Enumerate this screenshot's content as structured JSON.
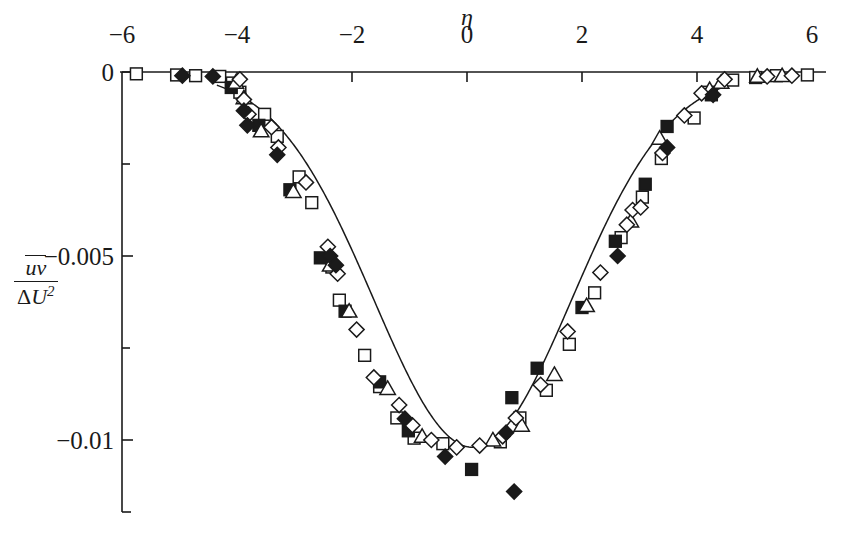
{
  "figure": {
    "background_color": "#ffffff",
    "ink_color": "#1a1a1a"
  },
  "axes": {
    "x_title": "η",
    "y_title_numerator": "uv",
    "y_title_denominator_delta": "Δ",
    "y_title_denominator_u": "U",
    "y_title_denominator_exp": "2",
    "x_ticks": [
      {
        "value": -6,
        "label": "−6"
      },
      {
        "value": -4,
        "label": "−4"
      },
      {
        "value": -2,
        "label": "−2"
      },
      {
        "value": 0,
        "label": "0"
      },
      {
        "value": 2,
        "label": "2"
      },
      {
        "value": 4,
        "label": "4"
      },
      {
        "value": 6,
        "label": "6"
      }
    ],
    "y_ticks": [
      {
        "value": 0,
        "label": "0"
      },
      {
        "value": -0.0025,
        "label": ""
      },
      {
        "value": -0.005,
        "label": "−0.005"
      },
      {
        "value": -0.0075,
        "label": ""
      },
      {
        "value": -0.01,
        "label": "−0.01"
      },
      {
        "value": -0.0125,
        "label": ""
      }
    ],
    "x_axis_position": "top",
    "y_axis_position": "left"
  },
  "chart_data": {
    "type": "scatter",
    "title": "",
    "xlabel": "η",
    "ylabel": "uv/ΔU²",
    "xlim": [
      -6.3,
      6.3
    ],
    "ylim": [
      -0.0132,
      0.0004
    ],
    "grid": false,
    "legend": "none",
    "axis_frame": "top-x-axis and left-y-axis only",
    "series": [
      {
        "name": "open-square",
        "marker": "square-open",
        "points": [
          [
            -5.75,
            -5e-05
          ],
          [
            -5.05,
            -8e-05
          ],
          [
            -4.72,
            -0.0001
          ],
          [
            -4.3,
            -0.00012
          ],
          [
            -4.08,
            -0.0003
          ],
          [
            -3.95,
            -0.00055
          ],
          [
            -3.52,
            -0.00115
          ],
          [
            -3.3,
            -0.00175
          ],
          [
            -2.92,
            -0.00285
          ],
          [
            -2.7,
            -0.00355
          ],
          [
            -2.35,
            -0.0053
          ],
          [
            -2.22,
            -0.0062
          ],
          [
            -1.78,
            -0.0077
          ],
          [
            -1.52,
            -0.00855
          ],
          [
            -1.22,
            -0.0094
          ],
          [
            -0.92,
            -0.00995
          ],
          [
            -0.42,
            -0.0101
          ],
          [
            0.58,
            -0.01005
          ],
          [
            0.92,
            -0.0094
          ],
          [
            1.38,
            -0.00865
          ],
          [
            1.78,
            -0.0074
          ],
          [
            2.22,
            -0.006
          ],
          [
            2.68,
            -0.0045
          ],
          [
            3.05,
            -0.0034
          ],
          [
            3.38,
            -0.00235
          ],
          [
            3.95,
            -0.00125
          ],
          [
            4.2,
            -0.00055
          ],
          [
            4.62,
            -0.00022
          ],
          [
            5.02,
            -0.00015
          ],
          [
            5.38,
            -0.0001
          ],
          [
            5.92,
            -8e-05
          ]
        ]
      },
      {
        "name": "filled-square",
        "marker": "square-filled",
        "points": [
          [
            -4.1,
            -0.00042
          ],
          [
            -3.62,
            -0.00145
          ],
          [
            -3.08,
            -0.0032
          ],
          [
            -2.55,
            -0.00505
          ],
          [
            -2.12,
            -0.0065
          ],
          [
            -1.52,
            -0.00842
          ],
          [
            -1.02,
            -0.00975
          ],
          [
            0.08,
            -0.0108
          ],
          [
            0.78,
            -0.00885
          ],
          [
            1.22,
            -0.00805
          ],
          [
            2.0,
            -0.0064
          ],
          [
            2.58,
            -0.0046
          ],
          [
            3.1,
            -0.00305
          ],
          [
            3.48,
            -0.00148
          ],
          [
            4.25,
            -0.00062
          ]
        ]
      },
      {
        "name": "open-triangle",
        "marker": "triangle-open",
        "points": [
          [
            -4.02,
            -0.00028
          ],
          [
            -3.88,
            -0.0007
          ],
          [
            -3.58,
            -0.0016
          ],
          [
            -3.02,
            -0.00325
          ],
          [
            -2.38,
            -0.00525
          ],
          [
            -2.05,
            -0.0065
          ],
          [
            -1.38,
            -0.0086
          ],
          [
            -0.78,
            -0.0099
          ],
          [
            0.45,
            -0.01
          ],
          [
            0.95,
            -0.0096
          ],
          [
            1.52,
            -0.00822
          ],
          [
            2.08,
            -0.00635
          ],
          [
            2.85,
            -0.00405
          ],
          [
            3.35,
            -0.0018
          ],
          [
            4.22,
            -0.00048
          ],
          [
            4.42,
            -0.00028
          ],
          [
            5.05,
            -0.00012
          ],
          [
            5.48,
            -0.0001
          ]
        ]
      },
      {
        "name": "open-diamond",
        "marker": "diamond-open",
        "points": [
          [
            -3.95,
            -0.0002
          ],
          [
            -3.88,
            -0.00075
          ],
          [
            -3.8,
            -0.00115
          ],
          [
            -3.4,
            -0.0015
          ],
          [
            -3.28,
            -0.00205
          ],
          [
            -2.8,
            -0.003
          ],
          [
            -2.42,
            -0.00475
          ],
          [
            -2.25,
            -0.00548
          ],
          [
            -1.92,
            -0.007
          ],
          [
            -1.62,
            -0.0083
          ],
          [
            -1.18,
            -0.00905
          ],
          [
            -0.95,
            -0.0096
          ],
          [
            -0.62,
            -0.01
          ],
          [
            -0.18,
            -0.0102
          ],
          [
            0.22,
            -0.01015
          ],
          [
            0.62,
            -0.0099
          ],
          [
            0.85,
            -0.0094
          ],
          [
            1.28,
            -0.0085
          ],
          [
            1.75,
            -0.00705
          ],
          [
            2.32,
            -0.00545
          ],
          [
            2.78,
            -0.00415
          ],
          [
            2.88,
            -0.00375
          ],
          [
            3.02,
            -0.00368
          ],
          [
            3.4,
            -0.0022
          ],
          [
            3.78,
            -0.00118
          ],
          [
            4.08,
            -0.00058
          ],
          [
            4.48,
            -0.0002
          ],
          [
            5.22,
            -0.00012
          ],
          [
            5.65,
            -0.0001
          ]
        ]
      },
      {
        "name": "filled-diamond",
        "marker": "diamond-filled",
        "points": [
          [
            -4.95,
            -0.0001
          ],
          [
            -4.42,
            -0.00012
          ],
          [
            -3.88,
            -0.00105
          ],
          [
            -3.82,
            -0.00145
          ],
          [
            -3.3,
            -0.00225
          ],
          [
            -2.38,
            -0.005
          ],
          [
            -2.28,
            -0.00525
          ],
          [
            -1.08,
            -0.00942
          ],
          [
            -0.38,
            -0.01045
          ],
          [
            0.68,
            -0.0098
          ],
          [
            0.82,
            -0.0114
          ],
          [
            2.62,
            -0.005
          ],
          [
            3.48,
            -0.00205
          ],
          [
            4.28,
            -0.00062
          ]
        ]
      }
    ],
    "fit_curve": {
      "name": "gaussian-fit-line",
      "description": "smooth solid curve through data, minimum near eta=0.1",
      "minimum_value": -0.0102,
      "minimum_x": 0.1
    }
  }
}
